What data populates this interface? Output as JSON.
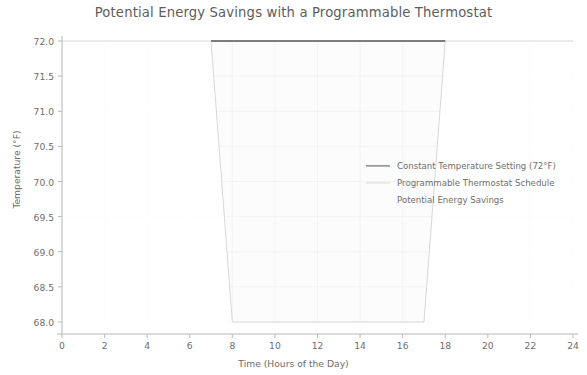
{
  "chart_data": {
    "type": "line",
    "title": "Potential Energy Savings with a Programmable Thermostat",
    "xlabel": "Time (Hours of the Day)",
    "ylabel": "Temperature (°F)",
    "xlim": [
      0,
      24
    ],
    "ylim": [
      68.0,
      72.0
    ],
    "xticks": [
      0,
      2,
      4,
      6,
      8,
      10,
      12,
      14,
      16,
      18,
      20,
      22,
      24
    ],
    "xtick_labels": [
      "0",
      "2",
      "4",
      "6",
      "8",
      "10",
      "12",
      "14",
      "16",
      "18",
      "20",
      "22",
      "24"
    ],
    "yticks": [
      68.0,
      68.5,
      69.0,
      69.5,
      70.0,
      70.5,
      71.0,
      71.5,
      72.0
    ],
    "ytick_labels": [
      "68.0",
      "68.5",
      "69.0",
      "69.5",
      "70.0",
      "70.5",
      "71.0",
      "71.5",
      "72.0"
    ],
    "grid": true,
    "grid_visible_region": "fill-only",
    "legend_position": "center-right",
    "series": [
      {
        "name": "Constant Temperature Setting (72°F)",
        "type": "line",
        "color": "#555555",
        "linewidth": 1.3,
        "x": [
          0,
          24
        ],
        "y": [
          72.0,
          72.0
        ]
      },
      {
        "name": "Programmable Thermostat Schedule",
        "type": "line",
        "color": "#d8d8d8",
        "linewidth": 1.0,
        "x": [
          0,
          7,
          8,
          17,
          18,
          24
        ],
        "y": [
          72.0,
          72.0,
          68.0,
          68.0,
          72.0,
          72.0
        ]
      },
      {
        "name": "Potential Energy Savings",
        "type": "fill_between",
        "color": "#fbfbfb",
        "alpha": 0.25,
        "x": [
          0,
          7,
          8,
          17,
          18,
          24
        ],
        "y_upper": [
          72.0,
          72.0,
          72.0,
          72.0,
          72.0,
          72.0
        ],
        "y_lower": [
          72.0,
          72.0,
          68.0,
          68.0,
          72.0,
          72.0
        ]
      }
    ],
    "legend": [
      {
        "label": "Constant Temperature Setting (72°F)",
        "marker": "line",
        "color": "#555555"
      },
      {
        "label": "Programmable Thermostat Schedule",
        "marker": "line",
        "color": "#d8d8d8"
      },
      {
        "label": "Potential Energy Savings",
        "marker": "patch",
        "color": "#fcfcfc"
      }
    ]
  }
}
